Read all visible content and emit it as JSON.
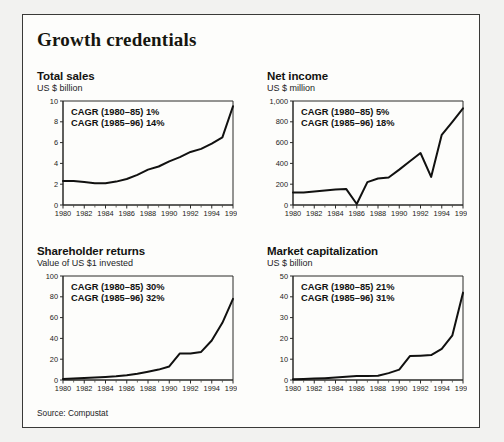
{
  "header": {
    "title": "Growth credentials"
  },
  "footer": {
    "source": "Source: Compustat"
  },
  "panels": [
    {
      "id": "total-sales",
      "title": "Total sales",
      "subtitle": "US $ billion",
      "annotations": [
        "CAGR (1980–85) 1%",
        "CAGR (1985–96) 14%"
      ]
    },
    {
      "id": "net-income",
      "title": "Net income",
      "subtitle": "US $ million",
      "annotations": [
        "CAGR (1980–85) 5%",
        "CAGR (1985–96) 18%"
      ]
    },
    {
      "id": "shareholder-returns",
      "title": "Shareholder returns",
      "subtitle": "Value of US $1 invested",
      "annotations": [
        "CAGR (1980–85) 30%",
        "CAGR (1985–96) 32%"
      ]
    },
    {
      "id": "market-capitalization",
      "title": "Market capitalization",
      "subtitle": "US $ billion",
      "annotations": [
        "CAGR (1980–85) 21%",
        "CAGR (1985–96) 31%"
      ]
    }
  ],
  "chart_data": [
    {
      "type": "line",
      "title": "Total sales",
      "xlabel": "",
      "ylabel": "US $ billion",
      "x": [
        1980,
        1981,
        1982,
        1983,
        1984,
        1985,
        1986,
        1987,
        1988,
        1989,
        1990,
        1991,
        1992,
        1993,
        1994,
        1995,
        1996
      ],
      "values": [
        2.3,
        2.3,
        2.2,
        2.1,
        2.1,
        2.25,
        2.5,
        2.9,
        3.4,
        3.7,
        4.2,
        4.6,
        5.1,
        5.4,
        5.9,
        6.5,
        9.5
      ],
      "ylim": [
        0,
        10
      ],
      "yticks": [
        0,
        2,
        4,
        6,
        8,
        10
      ],
      "yticklabels": [
        "0",
        "2",
        "4",
        "6",
        "8",
        "10"
      ],
      "xlim": [
        1980,
        1996
      ],
      "xticks": [
        1980,
        1982,
        1984,
        1986,
        1988,
        1990,
        1992,
        1994,
        1996
      ],
      "xticklabels": [
        "1980",
        "1982",
        "1984",
        "1986",
        "1988",
        "1990",
        "1992",
        "1994",
        "1996"
      ],
      "grid": false,
      "legend": "none",
      "annotations": [
        "CAGR (1980–85) 1%",
        "CAGR (1985–96) 14%"
      ]
    },
    {
      "type": "line",
      "title": "Net income",
      "xlabel": "",
      "ylabel": "US $ million",
      "x": [
        1980,
        1981,
        1982,
        1983,
        1984,
        1985,
        1986,
        1987,
        1988,
        1989,
        1990,
        1991,
        1992,
        1993,
        1994,
        1995,
        1996
      ],
      "values": [
        120,
        120,
        130,
        140,
        150,
        155,
        10,
        220,
        255,
        265,
        340,
        420,
        500,
        270,
        675,
        800,
        930
      ],
      "ylim": [
        0,
        1000
      ],
      "yticks": [
        0,
        200,
        400,
        600,
        800,
        1000
      ],
      "yticklabels": [
        "0",
        "200",
        "400",
        "600",
        "800",
        "1,000"
      ],
      "xlim": [
        1980,
        1996
      ],
      "xticks": [
        1980,
        1982,
        1984,
        1986,
        1988,
        1990,
        1992,
        1994,
        1996
      ],
      "xticklabels": [
        "1980",
        "1982",
        "1984",
        "1986",
        "1988",
        "1990",
        "1992",
        "1994",
        "1996"
      ],
      "grid": false,
      "legend": "none",
      "annotations": [
        "CAGR (1980–85) 5%",
        "CAGR (1985–96) 18%"
      ]
    },
    {
      "type": "line",
      "title": "Shareholder returns",
      "xlabel": "",
      "ylabel": "Value of US $1 invested",
      "x": [
        1980,
        1981,
        1982,
        1983,
        1984,
        1985,
        1986,
        1987,
        1988,
        1989,
        1990,
        1991,
        1992,
        1993,
        1994,
        1995,
        1996
      ],
      "values": [
        1,
        1.5,
        2,
        2.5,
        3,
        3.5,
        4.5,
        6,
        8,
        10,
        13,
        25.5,
        25.5,
        27,
        38,
        55,
        78
      ],
      "ylim": [
        0,
        100
      ],
      "yticks": [
        0,
        20,
        40,
        60,
        80,
        100
      ],
      "yticklabels": [
        "0",
        "20",
        "40",
        "60",
        "80",
        "100"
      ],
      "xlim": [
        1980,
        1996
      ],
      "xticks": [
        1980,
        1982,
        1984,
        1986,
        1988,
        1990,
        1992,
        1994,
        1996
      ],
      "xticklabels": [
        "1980",
        "1982",
        "1984",
        "1986",
        "1988",
        "1990",
        "1992",
        "1994",
        "1996"
      ],
      "grid": false,
      "legend": "none",
      "annotations": [
        "CAGR (1980–85) 30%",
        "CAGR (1985–96) 32%"
      ]
    },
    {
      "type": "line",
      "title": "Market capitalization",
      "xlabel": "",
      "ylabel": "US $ billion",
      "x": [
        1980,
        1981,
        1982,
        1983,
        1984,
        1985,
        1986,
        1987,
        1988,
        1989,
        1990,
        1991,
        1992,
        1993,
        1994,
        1995,
        1996
      ],
      "values": [
        0.4,
        0.5,
        0.7,
        0.9,
        1.2,
        1.6,
        1.9,
        1.9,
        2,
        3.3,
        5,
        11.5,
        11.7,
        12,
        15,
        21.5,
        42
      ],
      "ylim": [
        0,
        50
      ],
      "yticks": [
        0,
        10,
        20,
        30,
        40,
        50
      ],
      "yticklabels": [
        "0",
        "10",
        "20",
        "30",
        "40",
        "50"
      ],
      "xlim": [
        1980,
        1996
      ],
      "xticks": [
        1980,
        1982,
        1984,
        1986,
        1988,
        1990,
        1992,
        1994,
        1996
      ],
      "xticklabels": [
        "1980",
        "1982",
        "1984",
        "1986",
        "1988",
        "1990",
        "1992",
        "1994",
        "1996"
      ],
      "grid": false,
      "legend": "none",
      "annotations": [
        "CAGR (1980–85) 21%",
        "CAGR (1985–96) 31%"
      ]
    }
  ]
}
